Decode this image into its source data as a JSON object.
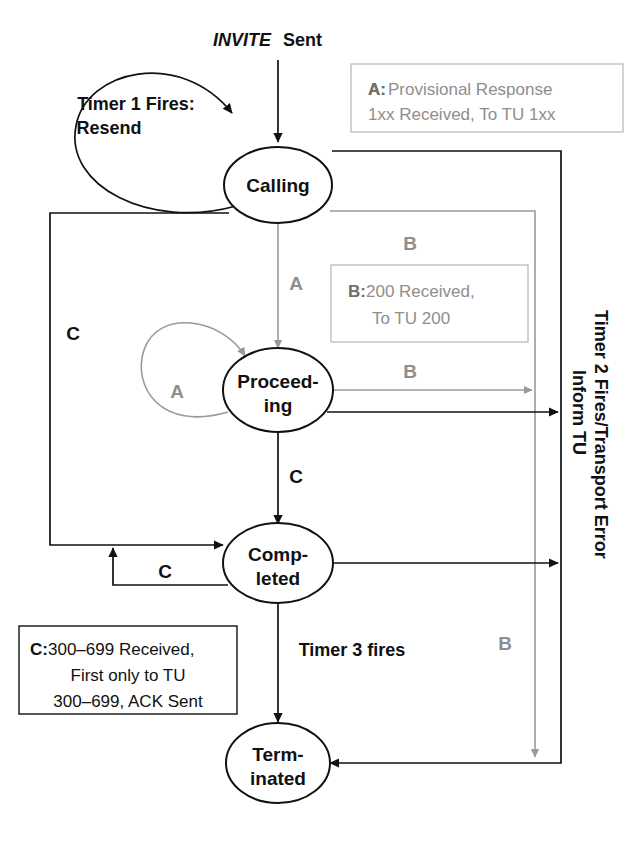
{
  "diagram": {
    "states": [
      {
        "id": "calling",
        "label_line1": "Calling",
        "label_line2": ""
      },
      {
        "id": "proceeding",
        "label_line1": "Proceed-",
        "label_line2": "ing"
      },
      {
        "id": "completed",
        "label_line1": "Comp-",
        "label_line2": "leted"
      },
      {
        "id": "terminated",
        "label_line1": "Term-",
        "label_line2": "inated"
      }
    ],
    "entry_label": {
      "italic": "INVITE",
      "rest": " Sent"
    },
    "edge_labels": {
      "timer1": {
        "line1": "Timer 1 Fires:",
        "line2": "Resend"
      },
      "calling_to_proceeding": "A",
      "calling_c": "C",
      "proceeding_self": "A",
      "proceeding_to_right_b": "B",
      "calling_right_b": "B",
      "proceeding_to_completed": "C",
      "completed_self": "C",
      "timer3": "Timer 3 fires",
      "b_down": "B"
    },
    "vertical_label": {
      "line1": "Timer 2 Fires/Transport Error",
      "line2": "Inform TU"
    },
    "legends": [
      {
        "id": "legend-a",
        "key": "A:",
        "line1": " Provisional Response",
        "line2": "1xx Received, To TU 1xx",
        "color": "#8e8e8e"
      },
      {
        "id": "legend-b",
        "key": "B:",
        "line1": " 200 Received,",
        "line2": "To TU 200",
        "color": "#8e8e8e"
      },
      {
        "id": "legend-c",
        "key": "C:",
        "line1": " 300–699 Received,",
        "line2": "First only to TU",
        "line3": "300–699, ACK Sent",
        "color": "#111111"
      }
    ],
    "colors": {
      "black": "#111111",
      "gray": "#9a9a9a",
      "legend_gray": "#8e8e8e",
      "background": "#ffffff"
    }
  }
}
